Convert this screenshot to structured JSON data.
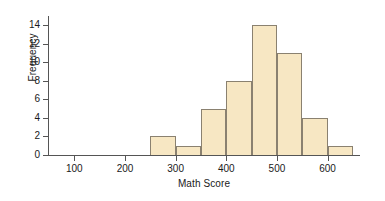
{
  "chart_data": {
    "type": "bar",
    "title": "",
    "subtitle": "",
    "xlabel": "Math Score",
    "ylabel": "Frequency",
    "categories": [
      "250-300",
      "300-350",
      "350-400",
      "400-450",
      "450-500",
      "500-550",
      "550-600",
      "600-650"
    ],
    "bin_edges": [
      250,
      300,
      350,
      400,
      450,
      500,
      550,
      600,
      650
    ],
    "bin_width": 50,
    "values": [
      2,
      1,
      5,
      8,
      14,
      11,
      4,
      1
    ],
    "x_ticks": [
      100,
      200,
      300,
      400,
      500,
      600
    ],
    "x_tick_labels": [
      "100",
      "200",
      "300",
      "400",
      "500",
      "600"
    ],
    "y_ticks": [
      0,
      2,
      4,
      6,
      8,
      10,
      12,
      14
    ],
    "y_tick_labels": [
      "0",
      "2",
      "4",
      "6",
      "8",
      "10",
      "12",
      "14"
    ],
    "xlim": [
      50,
      664
    ],
    "ylim": [
      0,
      15
    ],
    "grid": false,
    "legend": null,
    "bar_fill_color": "#F7E7C3",
    "bar_border_color": "#8a8170",
    "axis_color": "#555555",
    "text_color": "#1a1a1a",
    "background_color": "#ffffff"
  }
}
